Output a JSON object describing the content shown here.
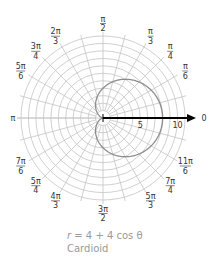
{
  "chart_data": {
    "type": "line",
    "subtype": "polar",
    "title": "",
    "equation": "r = 4 + 4 cos θ",
    "curve_name": "Cardioid",
    "function": {
      "a": 4,
      "b": 4,
      "trig": "cos"
    },
    "r_axis": {
      "max": 11,
      "ring_step": 1,
      "tick_labels": [
        {
          "value": 5,
          "label": "5"
        },
        {
          "value": 10,
          "label": "10"
        }
      ],
      "zero_label": "0"
    },
    "angle_grid_step_deg": 15,
    "angle_labels": [
      {
        "deg": 0,
        "num": "",
        "den": "",
        "single": "0"
      },
      {
        "deg": 30,
        "num": "π",
        "den": "6"
      },
      {
        "deg": 45,
        "num": "π",
        "den": "4"
      },
      {
        "deg": 60,
        "num": "π",
        "den": "3"
      },
      {
        "deg": 90,
        "num": "π",
        "den": "2"
      },
      {
        "deg": 120,
        "num": "2π",
        "den": "3"
      },
      {
        "deg": 135,
        "num": "3π",
        "den": "4"
      },
      {
        "deg": 150,
        "num": "5π",
        "den": "6"
      },
      {
        "deg": 180,
        "num": "",
        "den": "",
        "single": "π"
      },
      {
        "deg": 210,
        "num": "7π",
        "den": "6"
      },
      {
        "deg": 225,
        "num": "5π",
        "den": "4"
      },
      {
        "deg": 240,
        "num": "4π",
        "den": "3"
      },
      {
        "deg": 270,
        "num": "3π",
        "den": "2"
      },
      {
        "deg": 300,
        "num": "5π",
        "den": "3"
      },
      {
        "deg": 315,
        "num": "7π",
        "den": "4"
      },
      {
        "deg": 330,
        "num": "11π",
        "den": "6"
      }
    ],
    "sample_points": [
      {
        "theta": "0",
        "r": 8
      },
      {
        "theta": "π/3",
        "r": 6
      },
      {
        "theta": "π/2",
        "r": 4
      },
      {
        "theta": "2π/3",
        "r": 2
      },
      {
        "theta": "π",
        "r": 0
      },
      {
        "theta": "4π/3",
        "r": 2
      },
      {
        "theta": "3π/2",
        "r": 4
      },
      {
        "theta": "5π/3",
        "r": 6
      }
    ],
    "grid": true,
    "legend": null
  },
  "colors": {
    "grid": "#c4c4c4",
    "curve": "#8c8c8c",
    "axis": "#000000",
    "label": "#333333",
    "caption": "#9a9a9a"
  },
  "caption": {
    "var": "r",
    "rest": " = 4 + 4 cos θ",
    "name": "Cardioid"
  }
}
